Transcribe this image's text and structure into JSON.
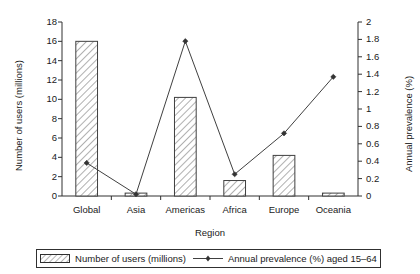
{
  "chart_data": {
    "type": "bar",
    "title": "",
    "categories": [
      "Global",
      "Asia",
      "Americas",
      "Africa",
      "Europe",
      "Oceania"
    ],
    "xlabel": "Region",
    "ylabel": "Number of users (millions)",
    "ylabel_right": "Annual prevalence (%)",
    "ylim": [
      0,
      18
    ],
    "ylim_right": [
      0,
      2
    ],
    "yticks": [
      "0",
      "2",
      "4",
      "6",
      "8",
      "10",
      "12",
      "14",
      "16",
      "18"
    ],
    "ytick_values": [
      0,
      2,
      4,
      6,
      8,
      10,
      12,
      14,
      16,
      18
    ],
    "yticks_right": [
      "0",
      "0.2",
      "0.4",
      "0.6",
      "0.8",
      "1",
      "1.2",
      "1.4",
      "1.6",
      "1.8",
      "2"
    ],
    "ytick_values_right": [
      0,
      0.2,
      0.4,
      0.6,
      0.8,
      1,
      1.2,
      1.4,
      1.6,
      1.8,
      2
    ],
    "grid": false,
    "legend_position": "bottom",
    "series": [
      {
        "name": "Number of users (millions)",
        "kind": "bar",
        "axis": "left",
        "fill": "hatch-diagonal",
        "values": [
          16.0,
          0.3,
          10.2,
          1.6,
          4.2,
          0.3
        ]
      },
      {
        "name": "Annual prevalence (%) aged 15–64",
        "kind": "line",
        "axis": "right",
        "marker": "diamond",
        "values": [
          0.38,
          0.02,
          1.78,
          0.25,
          0.72,
          1.37
        ]
      }
    ]
  },
  "legend": {
    "items": [
      {
        "label": "Number of users (millions)",
        "swatch": "hatch-swatch-icon"
      },
      {
        "label": "Annual prevalence (%) aged 15–64",
        "swatch": "line-marker-swatch-icon"
      }
    ]
  },
  "colors": {
    "axis": "#303030",
    "bar_outline": "#404040",
    "hatch": "#707070",
    "line": "#404040",
    "marker": "#333333",
    "background": "#ffffff"
  }
}
